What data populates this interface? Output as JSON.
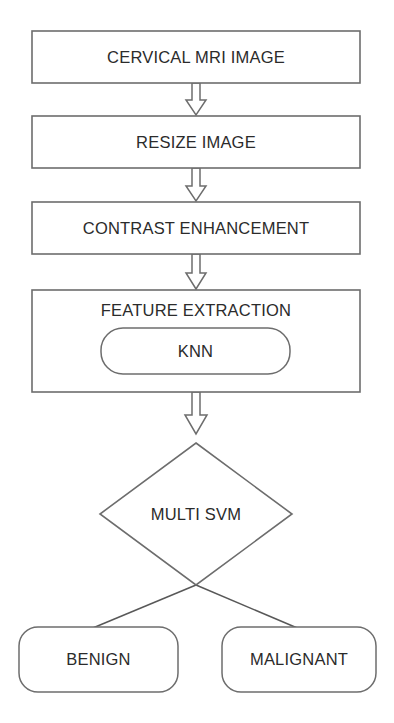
{
  "diagram": {
    "type": "flowchart",
    "orientation": "top-to-bottom",
    "title_text": "",
    "stroke_color": "#6d6d6d",
    "text_color": "#2b2b2b",
    "background_color": "#ffffff",
    "nodes": [
      {
        "id": "cervical-mri-image",
        "label": "CERVICAL MRI IMAGE",
        "shape": "rectangle",
        "x": 32,
        "y": 31,
        "w": 328,
        "h": 52
      },
      {
        "id": "resize-image",
        "label": "RESIZE IMAGE",
        "shape": "rectangle",
        "x": 32,
        "y": 116,
        "w": 328,
        "h": 52
      },
      {
        "id": "contrast-enhancement",
        "label": "CONTRAST ENHANCEMENT",
        "shape": "rectangle",
        "x": 32,
        "y": 202,
        "w": 328,
        "h": 52
      },
      {
        "id": "feature-extraction",
        "label": "FEATURE EXTRACTION",
        "shape": "rectangle",
        "x": 32,
        "y": 290,
        "w": 328,
        "h": 102
      },
      {
        "id": "knn",
        "label": "KNN",
        "shape": "rounded-rectangle",
        "x": 101,
        "y": 328,
        "w": 189,
        "h": 46
      },
      {
        "id": "multi-svm",
        "label": "MULTI SVM",
        "shape": "diamond",
        "x": 100,
        "y": 443,
        "w": 192,
        "h": 142
      },
      {
        "id": "benign",
        "label": "BENIGN",
        "shape": "rounded-rectangle",
        "x": 19,
        "y": 627,
        "w": 159,
        "h": 65
      },
      {
        "id": "malignant",
        "label": "MALIGNANT",
        "shape": "rounded-rectangle",
        "x": 222,
        "y": 627,
        "w": 154,
        "h": 65
      }
    ],
    "connectors": [
      {
        "id": "arrow-mri-to-resize",
        "from": "cervical-mri-image",
        "to": "resize-image",
        "style": "hollow-block-arrow",
        "direction": "down"
      },
      {
        "id": "arrow-resize-to-contrast",
        "from": "resize-image",
        "to": "contrast-enhancement",
        "style": "hollow-block-arrow",
        "direction": "down"
      },
      {
        "id": "arrow-contrast-to-feature",
        "from": "contrast-enhancement",
        "to": "feature-extraction",
        "style": "hollow-block-arrow",
        "direction": "down"
      },
      {
        "id": "arrow-feature-to-svm",
        "from": "feature-extraction",
        "to": "multi-svm",
        "style": "hollow-block-arrow",
        "direction": "down"
      },
      {
        "id": "line-svm-to-benign",
        "from": "multi-svm",
        "to": "benign",
        "style": "plain-line",
        "direction": "down-left"
      },
      {
        "id": "line-svm-to-malignant",
        "from": "multi-svm",
        "to": "malignant",
        "style": "plain-line",
        "direction": "down-right"
      }
    ]
  }
}
